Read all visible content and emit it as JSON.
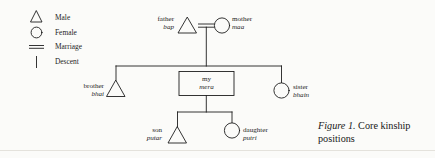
{
  "figure": {
    "caption_number": "Figure 1.",
    "caption_text": "Core kinship positions",
    "background_color": "#fbfbf9",
    "ink_color": "#1e1e1e"
  },
  "legend": {
    "items": [
      {
        "symbol": "triangle",
        "label": "Male"
      },
      {
        "symbol": "circle",
        "label": "Female"
      },
      {
        "symbol": "double-line",
        "label": "Marriage"
      },
      {
        "symbol": "vertical-line",
        "label": "Descent"
      }
    ]
  },
  "kin": {
    "father": {
      "english": "father",
      "vernacular": "bap",
      "symbol": "triangle"
    },
    "mother": {
      "english": "mother",
      "vernacular": "maa",
      "symbol": "circle"
    },
    "brother": {
      "english": "brother",
      "vernacular": "bhai",
      "symbol": "triangle"
    },
    "ego": {
      "english": "my",
      "vernacular": "mera",
      "symbol": "box"
    },
    "sister": {
      "english": "sister",
      "vernacular": "bhain",
      "symbol": "circle"
    },
    "son": {
      "english": "son",
      "vernacular": "putar",
      "symbol": "triangle"
    },
    "daughter": {
      "english": "daughter",
      "vernacular": "putri",
      "symbol": "circle"
    }
  }
}
